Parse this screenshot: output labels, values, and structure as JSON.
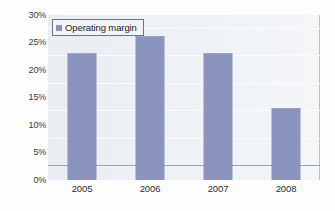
{
  "chart_data": {
    "type": "bar",
    "title": "",
    "xlabel": "",
    "ylabel": "",
    "categories": [
      "2005",
      "2006",
      "2007",
      "2008"
    ],
    "values": [
      23,
      26,
      23,
      13
    ],
    "series": [
      {
        "name": "Operating margin",
        "values": [
          23,
          26,
          23,
          13
        ]
      }
    ],
    "ylim": [
      0,
      30
    ],
    "ytick_labels": [
      "30%",
      "25%",
      "20%",
      "15%",
      "10%",
      "5%",
      "0%"
    ],
    "ytick_values": [
      30,
      25,
      20,
      15,
      10,
      5,
      0
    ],
    "ytick_step": 5,
    "grid": true,
    "legend_position": "top-left-inside",
    "legend": [
      "Operating margin"
    ],
    "value_suffix": "%",
    "colors": {
      "bar": "#8a94bd",
      "plot_background": "#eef1f5",
      "gridline": "#fbfcfd",
      "axis": "#9aa3ad",
      "text": "#2f2f2f",
      "legend_border": "#6d7680",
      "legend_background": "#f2f4f7"
    }
  }
}
